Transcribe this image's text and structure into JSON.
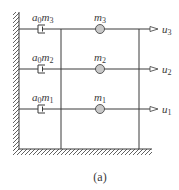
{
  "figure": {
    "caption": "(a)",
    "colors": {
      "line": "#3a3a3a",
      "mass_fill": "#c8c8c8",
      "background": "#ffffff"
    },
    "floors": [
      {
        "level": 3,
        "mass_label": "m",
        "mass_sub": "3",
        "damper_label_a": "a",
        "damper_label_a_sub": "0",
        "damper_label_m": "m",
        "damper_label_m_sub": "3",
        "dof_label": "u",
        "dof_sub": "3"
      },
      {
        "level": 2,
        "mass_label": "m",
        "mass_sub": "2",
        "damper_label_a": "a",
        "damper_label_a_sub": "0",
        "damper_label_m": "m",
        "damper_label_m_sub": "2",
        "dof_label": "u",
        "dof_sub": "2"
      },
      {
        "level": 1,
        "mass_label": "m",
        "mass_sub": "1",
        "damper_label_a": "a",
        "damper_label_a_sub": "0",
        "damper_label_m": "m",
        "damper_label_m_sub": "1",
        "dof_label": "u",
        "dof_sub": "1"
      }
    ]
  }
}
